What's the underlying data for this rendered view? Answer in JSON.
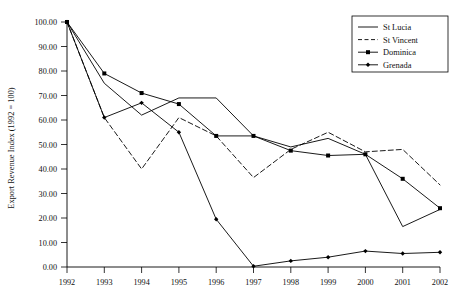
{
  "chart_data": {
    "type": "line",
    "title": "",
    "xlabel": "",
    "ylabel": "Export Revenue Index (1992 = 100)",
    "x": [
      1992,
      1993,
      1994,
      1995,
      1996,
      1997,
      1998,
      1999,
      2000,
      2001,
      2002
    ],
    "categories": [
      "1992",
      "1993",
      "1994",
      "1995",
      "1996",
      "1997",
      "1998",
      "1999",
      "2000",
      "2001",
      "2002"
    ],
    "xlim": [
      1992,
      2002
    ],
    "ylim": [
      0,
      100
    ],
    "ytick_labels": [
      "0.00",
      "10.00",
      "20.00",
      "30.00",
      "40.00",
      "50.00",
      "60.00",
      "70.00",
      "80.00",
      "90.00",
      "100.00"
    ],
    "ytick_values": [
      0,
      10,
      20,
      30,
      40,
      50,
      60,
      70,
      80,
      90,
      100
    ],
    "grid": false,
    "legend_position": "top-right",
    "series": [
      {
        "name": "St Lucia",
        "style": "solid",
        "marker": "none",
        "color": "#000000",
        "values": [
          100.0,
          75.0,
          62.0,
          69.0,
          69.0,
          53.5,
          49.0,
          52.5,
          46.0,
          16.5,
          23.5
        ]
      },
      {
        "name": "St Vincent",
        "style": "dashed",
        "marker": "none",
        "color": "#000000",
        "values": [
          100.0,
          61.0,
          40.0,
          61.0,
          53.5,
          36.5,
          48.0,
          55.0,
          47.0,
          48.0,
          33.5
        ]
      },
      {
        "name": "Dominica",
        "style": "solid",
        "marker": "square",
        "color": "#000000",
        "values": [
          100.0,
          79.0,
          71.0,
          66.5,
          53.5,
          53.5,
          47.5,
          45.5,
          46.0,
          36.0,
          24.0
        ]
      },
      {
        "name": "Grenada",
        "style": "solid",
        "marker": "diamond",
        "color": "#000000",
        "values": [
          100.0,
          61.0,
          67.0,
          55.0,
          19.5,
          0.3,
          2.5,
          4.0,
          6.5,
          5.5,
          6.0
        ]
      }
    ],
    "series_endpoints_2002": {
      "St Lucia": 32.0,
      "St Vincent": 38.0,
      "Dominica": 24.0,
      "Grenada": 6.0
    }
  },
  "legend": {
    "items": [
      {
        "label": "St Lucia"
      },
      {
        "label": "St Vincent"
      },
      {
        "label": "Dominica"
      },
      {
        "label": "Grenada"
      }
    ]
  }
}
